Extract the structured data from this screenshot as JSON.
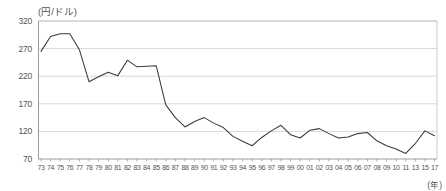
{
  "chart_data": {
    "type": "line",
    "title": "",
    "ylabel": "(円/ドル)",
    "xlabel": "(年)",
    "ylim": [
      70,
      320
    ],
    "yticks": [
      70,
      120,
      170,
      220,
      270,
      320
    ],
    "grid": true,
    "legend": "none",
    "categories": [
      "73",
      "74",
      "75",
      "76",
      "77",
      "78",
      "79",
      "80",
      "81",
      "82",
      "83",
      "84",
      "85",
      "86",
      "87",
      "88",
      "89",
      "90",
      "91",
      "92",
      "93",
      "94",
      "95",
      "96",
      "97",
      "98",
      "99",
      "00",
      "01",
      "02",
      "03",
      "04",
      "05",
      "06",
      "07",
      "08",
      "09",
      "10",
      "11",
      "13",
      "15",
      "17"
    ],
    "series": [
      {
        "name": "円ドル相場",
        "values": [
          265,
          292,
          297,
          297,
          268,
          210,
          219,
          227,
          221,
          249,
          237,
          238,
          239,
          168,
          145,
          128,
          138,
          145,
          135,
          127,
          111,
          102,
          94,
          109,
          121,
          131,
          114,
          108,
          122,
          125,
          116,
          108,
          110,
          116,
          118,
          103,
          94,
          88,
          80,
          98,
          121,
          112
        ]
      }
    ]
  },
  "axis": {
    "y_unit_label": "(円/ドル)",
    "x_unit_label": "(年)"
  }
}
